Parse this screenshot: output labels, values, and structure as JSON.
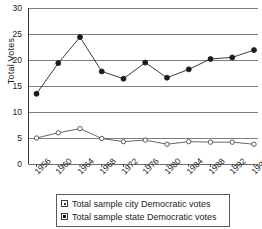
{
  "chart_data": {
    "type": "line",
    "title": "",
    "xlabel": "",
    "ylabel": "Total Votes",
    "categories": [
      "1956",
      "1960",
      "1964",
      "1968",
      "1972",
      "1976",
      "1980",
      "1984",
      "1988",
      "1992",
      "1996"
    ],
    "ylim": [
      0,
      30
    ],
    "yticks": [
      0,
      5,
      10,
      15,
      20,
      25,
      30
    ],
    "ytick_labels": [
      "0",
      "5",
      "10",
      "15",
      "20",
      "25",
      "30"
    ],
    "grid": true,
    "legend_position": "bottom",
    "series": [
      {
        "name": "Total sample city Democratic votes",
        "marker": "open-circle",
        "values": [
          5.0,
          6.0,
          6.8,
          4.9,
          4.3,
          4.6,
          3.8,
          4.3,
          4.2,
          4.2,
          3.8
        ]
      },
      {
        "name": "Total sample state Democratic votes",
        "marker": "filled-circle",
        "values": [
          13.5,
          19.4,
          24.4,
          17.8,
          16.4,
          19.5,
          16.6,
          18.2,
          20.2,
          20.5,
          21.9
        ]
      }
    ]
  },
  "legend": {
    "items": [
      {
        "label": "Total sample city Democratic votes",
        "marker": "open-square-dot-icon"
      },
      {
        "label": "Total sample state Democratic votes",
        "marker": "filled-square-icon"
      }
    ]
  },
  "colors": {
    "axis": "#3a3a3a",
    "grid": "#6e6e6e",
    "series_city": "#4a4a4a",
    "series_state": "#1a1a1a",
    "background": "#ffffff"
  }
}
